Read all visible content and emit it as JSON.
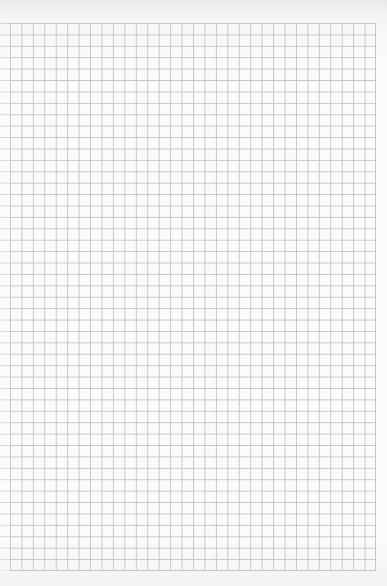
{
  "page": {
    "type": "graph-paper",
    "grid": {
      "columns": 32,
      "rows": 48
    },
    "colors": {
      "paper": "#fbfbfb",
      "grid_line": "#c6c6c6"
    }
  }
}
